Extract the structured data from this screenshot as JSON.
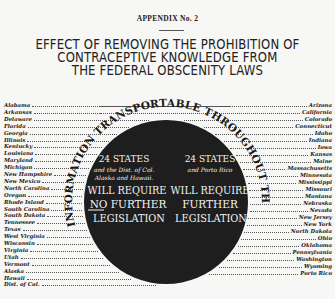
{
  "header": {
    "appendix": "APPENDIX No. 2",
    "title_lines": [
      "EFFECT OF REMOVING THE PROHIBITION OF",
      "CONTRACEPTIVE KNOWLEDGE  FROM",
      "THE FEDERAL OBSCENITY LAWS"
    ]
  },
  "circle": {
    "arc_text": "INFORMATION TRANSPORTABLE THROUGHOUT THE U.S.",
    "left_group": {
      "count": "24 STATES",
      "subtitle_1": "and the Dist. of Col.",
      "subtitle_2": "Alaska and Hawaii.",
      "line_1": "WILL REQUIRE",
      "line_2_emph": "NO",
      "line_2_rest": " FURTHER",
      "line_3": "LEGISLATION"
    },
    "right_group": {
      "count": "24 STATES",
      "subtitle_1": "and Porto Rico",
      "line_1": "WILL REQUIRE",
      "line_2": "FURTHER",
      "line_3": "LEGISLATION"
    },
    "colors": {
      "disc": "#1e1e1e",
      "text_on_disc": "#f2f2f2"
    }
  },
  "left_states": [
    "Alabama",
    "Arkansas",
    "Delaware",
    "Florida",
    "Georgia",
    "Illinois",
    "Kentucky",
    "Louisiana",
    "Maryland",
    "Michigan",
    "New Hampshire",
    "New Mexico",
    "North Carolina",
    "Oregon",
    "Rhode Island",
    "South Carolina",
    "South Dakota",
    "Tennessee",
    "Texas",
    "West Virginia",
    "Wisconsin",
    "Virginia",
    "Utah",
    "Vermont",
    "Alaska",
    "Hawaii",
    "Dist. of Col."
  ],
  "right_states": [
    "Arizona",
    "California",
    "Colorado",
    "Connecticut",
    "Idaho",
    "Indiana",
    "Iowa",
    "Kansas",
    "Maine",
    "Massachusetts",
    "Minnesota",
    "Mississippi",
    "Missouri",
    "Montana",
    "Nebraska",
    "Nevada",
    "New Jersey",
    "New York",
    "North Dakota",
    "Ohio",
    "Oklahoma",
    "Pennsylvania",
    "Washington",
    "Wyoming",
    "Porto Rico"
  ]
}
